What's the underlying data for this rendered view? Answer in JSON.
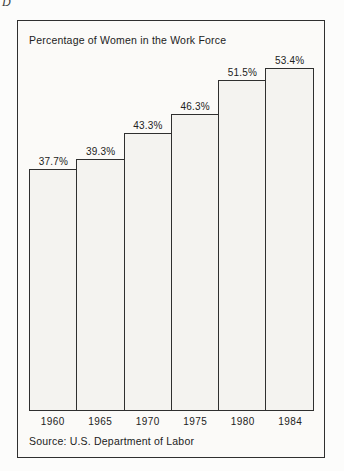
{
  "page": {
    "corner_letter": "D"
  },
  "chart_data": {
    "type": "bar",
    "title": "Percentage of Women in the Work Force",
    "categories": [
      "1960",
      "1965",
      "1970",
      "1975",
      "1980",
      "1984"
    ],
    "values": [
      37.7,
      39.3,
      43.3,
      46.3,
      51.5,
      53.4
    ],
    "value_labels": [
      "37.7%",
      "39.3%",
      "43.3%",
      "46.3%",
      "51.5%",
      "53.4%"
    ],
    "xlabel": "",
    "ylabel": "",
    "ylim": [
      0,
      55
    ],
    "grid": false,
    "legend": null,
    "source": "Source: U.S. Department of Labor",
    "bar_fill_color": "#f4f3f0",
    "line_color": "#2f2f2f",
    "background_color": "#fbfaf8"
  }
}
